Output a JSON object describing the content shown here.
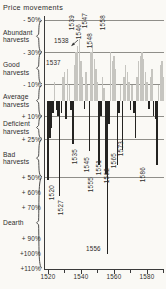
{
  "title": "Price movements",
  "colors": {
    "abundant_bar": "#c6c5c0",
    "deficit_bar": "#242321",
    "axis": "#3a3a3a",
    "grid": "#74736e",
    "text": "#2e2d2b",
    "background": "#faf9f5"
  },
  "chart_data": {
    "type": "bar",
    "title": "Price movements",
    "orientation": "inverted-y (price fall / abundant harvest drawn upward in grey, price rise / dearth drawn downward in black)",
    "start_year": 1520,
    "end_year": 1590,
    "values_percent": [
      52,
      24,
      18,
      8,
      -12,
      6,
      10,
      62,
      8,
      -15,
      -18,
      12,
      -20,
      -10,
      6,
      28,
      -22,
      -30,
      -34,
      -38,
      -25,
      -15,
      5,
      -18,
      -10,
      33,
      -30,
      -36,
      -26,
      -20,
      -12,
      42,
      10,
      -15,
      -8,
      48,
      100,
      15,
      -30,
      -25,
      -28,
      -20,
      42,
      8,
      -10,
      32,
      -15,
      -22,
      -18,
      -12,
      6,
      -10,
      8,
      24,
      -15,
      -25,
      -28,
      -30,
      -26,
      -18,
      -12,
      5,
      -15,
      -20,
      10,
      12,
      42,
      -10,
      -22,
      -25,
      -15
    ],
    "y_axis_labels": [
      {
        "text": "- 50%",
        "value": -50
      },
      {
        "text": "- 30%",
        "value": -30
      },
      {
        "text": "- 10%",
        "value": -10
      },
      {
        "text": "+ 10%",
        "value": 10
      },
      {
        "text": "+ 25%",
        "value": 25
      },
      {
        "text": "+ 50%",
        "value": 50
      },
      {
        "text": "+ 60%",
        "value": 60
      },
      {
        "text": "+ 70%",
        "value": 70
      },
      {
        "text": "+ 90%",
        "value": 90
      },
      {
        "text": "+100%",
        "value": 100
      },
      {
        "text": "+110%",
        "value": 110
      }
    ],
    "y_gridlines": [
      -50,
      -30,
      -10,
      10,
      25,
      50
    ],
    "bands": [
      {
        "lines": [
          "Abundant",
          "harvests"
        ],
        "from": -50,
        "to": -30
      },
      {
        "lines": [
          "Good",
          "harvests"
        ],
        "from": -30,
        "to": -10
      },
      {
        "lines": [
          "Average",
          "harvests"
        ],
        "from": -10,
        "to": 10
      },
      {
        "lines": [
          "Deficient",
          "harvests"
        ],
        "from": 10,
        "to": 25
      },
      {
        "lines": [
          "Bad",
          "harvests"
        ],
        "from": 25,
        "to": 50
      },
      {
        "lines": [
          "Dearth"
        ],
        "from": 50,
        "to": 110
      }
    ],
    "x_ticks_major": [
      {
        "text": "1520",
        "year": 1520
      },
      {
        "text": "1540",
        "year": 1540
      },
      {
        "text": "1560",
        "year": 1560
      },
      {
        "text": "1580",
        "year": 1580
      }
    ],
    "x_ticks_minor": [
      1530,
      1550,
      1570,
      1590
    ],
    "annotations": {
      "horizontal": [
        {
          "text": "1538",
          "x": 54,
          "y": 37,
          "arrow_to": [
            77,
            45
          ]
        },
        {
          "text": "1537",
          "x": 46,
          "y": 59
        },
        {
          "text": "1556",
          "x": 86,
          "y": 245
        }
      ],
      "rotated": [
        {
          "text": "1539",
          "x": 71,
          "y": 15
        },
        {
          "text": "1546",
          "x": 78,
          "y": 24
        },
        {
          "text": "1547",
          "x": 84,
          "y": 13
        },
        {
          "text": "1548",
          "x": 89,
          "y": 33
        },
        {
          "text": "1558",
          "x": 102,
          "y": 15
        },
        {
          "text": "1520",
          "x": 51,
          "y": 185
        },
        {
          "text": "1527",
          "x": 60,
          "y": 200
        },
        {
          "text": "1535",
          "x": 74,
          "y": 149
        },
        {
          "text": "1545",
          "x": 86,
          "y": 157
        },
        {
          "text": "1555",
          "x": 90,
          "y": 177
        },
        {
          "text": "1551",
          "x": 98,
          "y": 160
        },
        {
          "text": "1562",
          "x": 106,
          "y": 168
        },
        {
          "text": "1565",
          "x": 113,
          "y": 153
        },
        {
          "text": "1573",
          "x": 120,
          "y": 141
        },
        {
          "text": "1586",
          "x": 142,
          "y": 167
        }
      ]
    }
  }
}
